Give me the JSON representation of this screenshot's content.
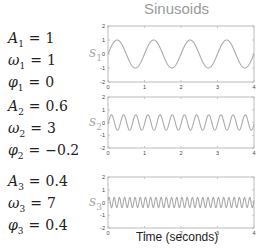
{
  "title": "Sinusoids",
  "xlabel": "Time (seconds)",
  "params": [
    {
      "A_sym": "A",
      "w_sym": "ω",
      "p_sym": "φ",
      "idx": "1",
      "A": "1",
      "omega": "1",
      "phi": "0"
    },
    {
      "A_sym": "A",
      "w_sym": "ω",
      "p_sym": "φ",
      "idx": "2",
      "A": "0.6",
      "omega": "3",
      "phi": "−0.2"
    },
    {
      "A_sym": "A",
      "w_sym": "ω",
      "p_sym": "φ",
      "idx": "3",
      "A": "0.4",
      "omega": "7",
      "phi": "0.4"
    }
  ],
  "series_labels": [
    {
      "sym": "s",
      "idx": "1"
    },
    {
      "sym": "s",
      "idx": "2"
    },
    {
      "sym": "s",
      "idx": "3"
    }
  ],
  "colors": {
    "line": "#aaaaaa",
    "axis": "#bbbbbb",
    "tick_text": "#444444",
    "title": "#9a9a9a"
  },
  "chart_data": [
    {
      "type": "line",
      "title": "Sinusoids",
      "xlabel": "",
      "ylabel": "s1",
      "xlim": [
        0,
        4
      ],
      "ylim": [
        -2,
        2
      ],
      "xticks": [
        0,
        1,
        2,
        3,
        4
      ],
      "yticks": [
        2,
        1,
        0,
        -1,
        -2
      ],
      "function": "A*sin(2*pi*omega*t + phi)",
      "amplitude": 1,
      "frequency_hz": 1,
      "phase": 0,
      "grid": false
    },
    {
      "type": "line",
      "xlabel": "",
      "ylabel": "s2",
      "xlim": [
        0,
        4
      ],
      "ylim": [
        -2,
        2
      ],
      "xticks": [
        0,
        1,
        2,
        3,
        4
      ],
      "yticks": [
        2,
        1,
        0,
        -1,
        -2
      ],
      "function": "A*sin(2*pi*omega*t + phi)",
      "amplitude": 0.6,
      "frequency_hz": 3,
      "phase": -0.2,
      "grid": false
    },
    {
      "type": "line",
      "xlabel": "Time (seconds)",
      "ylabel": "s3",
      "xlim": [
        0,
        4
      ],
      "ylim": [
        -2,
        2
      ],
      "xticks": [
        0,
        1,
        2,
        3,
        4
      ],
      "yticks": [
        2,
        1,
        0,
        -1,
        -2
      ],
      "function": "A*sin(2*pi*omega*t + phi)",
      "amplitude": 0.4,
      "frequency_hz": 7,
      "phase": 0.4,
      "grid": false
    }
  ]
}
